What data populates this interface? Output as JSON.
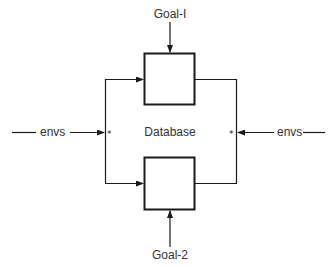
{
  "diagram": {
    "center_label": "Database",
    "goal_top": "Goal-I",
    "goal_bottom": "Goal-2",
    "input_left": "envs",
    "input_right": "envs",
    "junction_left": "*",
    "junction_right": "*"
  },
  "colors": {
    "line": "#1a1a1a",
    "text": "#333333",
    "background": "#ffffff"
  }
}
